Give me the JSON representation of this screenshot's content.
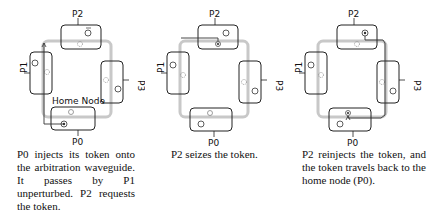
{
  "panels": [
    {
      "id": "step-1",
      "nodes": {
        "p0": "P0",
        "p1": "P1",
        "p2": "P2",
        "p3": "P3"
      },
      "home_label": "Home Node",
      "caption": "P0 injects its token onto the arbitration waveguide. It passes by P1 unperturbed. P2 requests the token."
    },
    {
      "id": "step-2",
      "nodes": {
        "p0": "P0",
        "p1": "P1",
        "p2": "P2",
        "p3": "P3"
      },
      "caption": "P2 seizes the token."
    },
    {
      "id": "step-3",
      "nodes": {
        "p0": "P0",
        "p1": "P1",
        "p2": "P2",
        "p3": "P3"
      },
      "caption": "P2 reinjects the token, and the token travels back to the home node (P0)."
    }
  ],
  "colors": {
    "waveguide": "#c8c8c8",
    "box_stroke": "#222222",
    "token_path": "#333333"
  }
}
